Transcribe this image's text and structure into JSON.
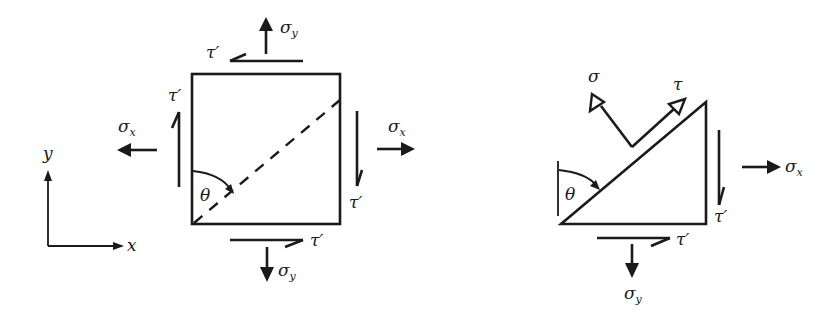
{
  "figure": {
    "left_panel": {
      "description": "Square stress element with normal and shear stresses and a dashed inclined plane at angle theta",
      "labels": {
        "sigma_y_top": "σ",
        "sigma_y_top_sub": "y",
        "tau_top": "τ′",
        "tau_left": "τ′",
        "sigma_x_left": "σ",
        "sigma_x_left_sub": "x",
        "sigma_x_right": "σ",
        "sigma_x_right_sub": "x",
        "tau_right": "τ′",
        "tau_bottom": "τ′",
        "sigma_y_bottom": "σ",
        "sigma_y_bottom_sub": "y",
        "theta": "θ"
      },
      "axes": {
        "y_label": "y",
        "x_label": "x"
      }
    },
    "right_panel": {
      "description": "Triangular wedge free body cut along inclined plane showing normal stress sigma and shear stress tau",
      "labels": {
        "sigma": "σ",
        "tau": "τ",
        "theta": "θ",
        "tau_right": "τ′",
        "sigma_x": "σ",
        "sigma_x_sub": "x",
        "tau_bottom": "τ′",
        "sigma_y": "σ",
        "sigma_y_sub": "y"
      }
    }
  },
  "colors": {
    "ink": "#1a1a1a",
    "background": "#ffffff"
  }
}
